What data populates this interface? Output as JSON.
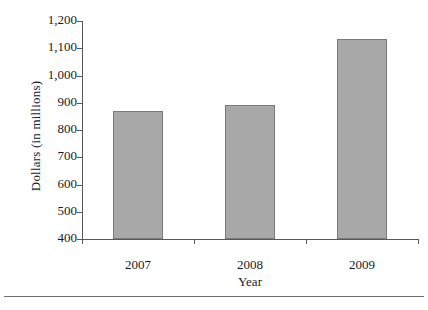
{
  "chart_data": {
    "type": "bar",
    "title": "",
    "xlabel": "Year",
    "ylabel": "Dollars (in millions)",
    "categories": [
      "2007",
      "2008",
      "2009"
    ],
    "values": [
      870,
      890,
      1135
    ],
    "ylim": [
      400,
      1200
    ],
    "yticks": [
      400,
      500,
      600,
      700,
      800,
      900,
      1000,
      1100,
      1200
    ],
    "ytick_labels": [
      "400",
      "500",
      "600",
      "700",
      "800",
      "900",
      "1,000",
      "1,100",
      "1,200"
    ],
    "grid": false,
    "legend": false,
    "series": [
      {
        "name": "Dollars (in millions)",
        "values": [
          870,
          890,
          1135
        ]
      }
    ],
    "colors": {
      "bar_fill": "#a8a8a8",
      "bar_border": "#7b7b7b",
      "axis": "#55585c",
      "text": "#1a1a1a",
      "background": "#ffffff",
      "rule": "#6e6e6e"
    }
  }
}
